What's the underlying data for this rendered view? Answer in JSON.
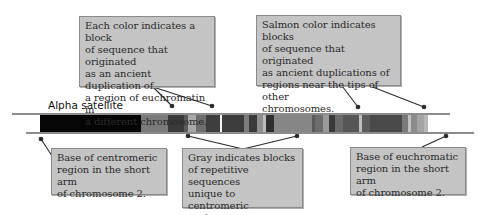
{
  "diagram": {
    "labels": {
      "alpha_satellite": "Alpha satellite"
    },
    "callouts": {
      "color_blocks": "Each color indicates a block\nof sequence that originated\nas an ancient duplication of\na region of euchromatin in\na different chromosome.",
      "salmon_blocks": "Salmon color indicates blocks\nof sequence that originated\nas ancient duplications of\nregions near the tips of other\nchromosomes.",
      "centromeric_base": "Base of centromeric\nregion in the short arm\nof chromosome 2.",
      "gray_blocks": "Gray indicates blocks\nof repetitive sequences\nunique to centromeric\nregions.",
      "euchromatic_base": "Base of euchromatic\nregion in the short arm\nof chromosome 2."
    },
    "colors": {
      "alpha_satellite": "#050505",
      "callout_fill": "#c4c4c4",
      "callout_border": "#8a8a8a",
      "leader_line": "#2a2a2a"
    },
    "bands": [
      {
        "x": 40,
        "w": 101,
        "color": "#050505"
      },
      {
        "x": 141,
        "w": 27,
        "color": "#7a7a7a"
      },
      {
        "x": 168,
        "w": 16,
        "color": "#3a3a3a"
      },
      {
        "x": 184,
        "w": 4,
        "color": "#5a5a5a"
      },
      {
        "x": 188,
        "w": 8,
        "color": "#a8a8a8"
      },
      {
        "x": 196,
        "w": 10,
        "color": "#6e6e6e"
      },
      {
        "x": 206,
        "w": 14,
        "color": "#3e3e3e"
      },
      {
        "x": 220,
        "w": 2,
        "color": "#f4f4f4"
      },
      {
        "x": 222,
        "w": 22,
        "color": "#3c3c3c"
      },
      {
        "x": 244,
        "w": 5,
        "color": "#7c7c7c"
      },
      {
        "x": 249,
        "w": 8,
        "color": "#3a3a3a"
      },
      {
        "x": 257,
        "w": 6,
        "color": "#8e8e8e"
      },
      {
        "x": 263,
        "w": 3,
        "color": "#bdbdbd"
      },
      {
        "x": 266,
        "w": 8,
        "color": "#303030"
      },
      {
        "x": 274,
        "w": 38,
        "color": "#868686"
      },
      {
        "x": 312,
        "w": 3,
        "color": "#5a5a5a"
      },
      {
        "x": 315,
        "w": 8,
        "color": "#6c6c6c"
      },
      {
        "x": 323,
        "w": 6,
        "color": "#9a9a9a"
      },
      {
        "x": 329,
        "w": 6,
        "color": "#3a3a3a"
      },
      {
        "x": 335,
        "w": 8,
        "color": "#6a6a6a"
      },
      {
        "x": 343,
        "w": 16,
        "color": "#565656"
      },
      {
        "x": 359,
        "w": 3,
        "color": "#bebebe"
      },
      {
        "x": 362,
        "w": 8,
        "color": "#5c5c5c"
      },
      {
        "x": 370,
        "w": 32,
        "color": "#4a4a4a"
      },
      {
        "x": 402,
        "w": 6,
        "color": "#7a7a7a"
      },
      {
        "x": 408,
        "w": 3,
        "color": "#c2c2c2"
      },
      {
        "x": 411,
        "w": 6,
        "color": "#8c8c8c"
      },
      {
        "x": 417,
        "w": 7,
        "color": "#a4a4a4"
      },
      {
        "x": 424,
        "w": 4,
        "color": "#b8b8b8"
      }
    ]
  }
}
